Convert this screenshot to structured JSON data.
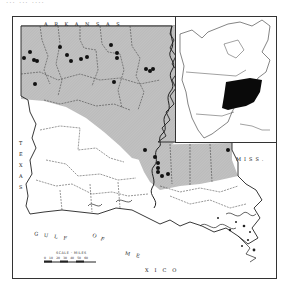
{
  "figure": {
    "top_caption_fragment": "... ... ....",
    "labels": {
      "north_state": "ARKANSAS",
      "west_state": "TEXAS",
      "east_state": "MISS.",
      "gulf_parts": [
        "GULF",
        "OF",
        "ME",
        "XICO"
      ]
    },
    "scale": {
      "title": "SCALE · MILES",
      "ticks": [
        "0",
        "10",
        "20",
        "30",
        "40",
        "50",
        "60"
      ]
    },
    "colors": {
      "range_shading": "#bdbdbd",
      "outline": "#2a2a2a",
      "dot": "#111111",
      "inset_range": "#0a0a0a",
      "background": "#ffffff"
    },
    "locality_dots": [
      [
        24,
        58
      ],
      [
        30,
        52
      ],
      [
        34,
        60
      ],
      [
        37,
        61
      ],
      [
        60,
        47
      ],
      [
        67,
        55
      ],
      [
        71,
        61
      ],
      [
        81,
        59
      ],
      [
        87,
        57
      ],
      [
        111,
        45
      ],
      [
        117,
        53
      ],
      [
        117,
        58
      ],
      [
        146,
        69
      ],
      [
        150,
        71
      ],
      [
        153,
        69
      ],
      [
        35,
        84
      ],
      [
        114,
        82
      ],
      [
        145,
        150
      ],
      [
        155,
        157
      ],
      [
        158,
        163
      ],
      [
        158,
        168
      ],
      [
        158,
        172
      ],
      [
        168,
        174
      ],
      [
        162,
        176
      ],
      [
        228,
        150
      ]
    ],
    "inset": {
      "title": "North America range inset",
      "range_description": "Eastern United States"
    }
  }
}
